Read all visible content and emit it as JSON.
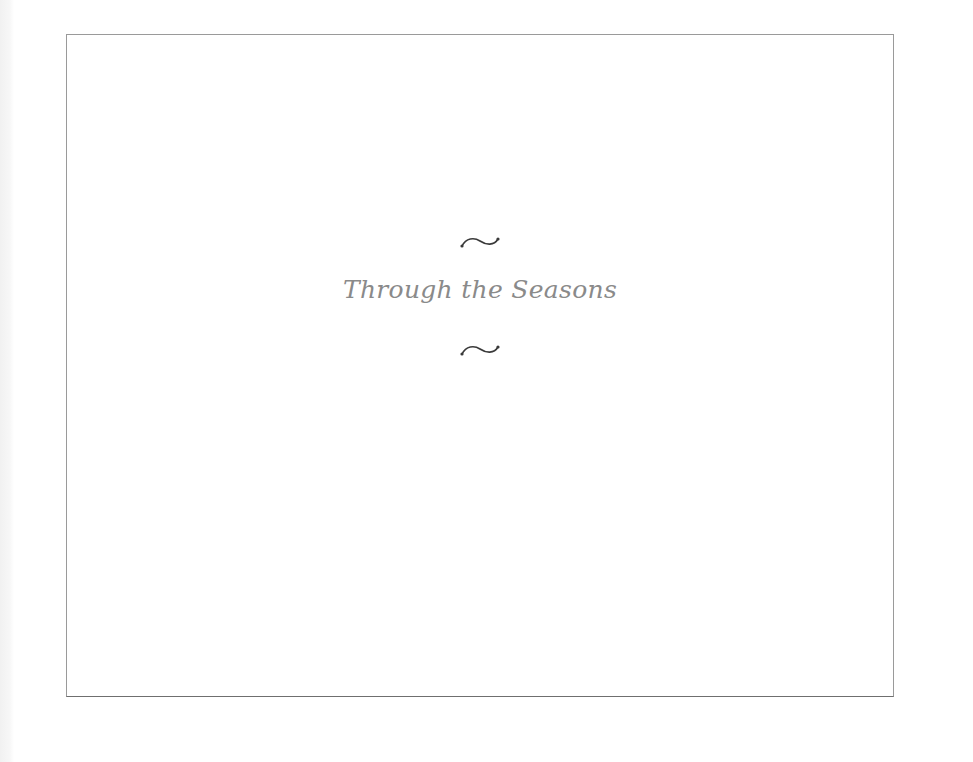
{
  "page": {
    "title": "Through the Seasons",
    "ornaments": [
      "tilde-swash-icon",
      "tilde-swash-icon"
    ],
    "colors": {
      "title_text": "#8a8a8a",
      "ornament": "#3a3a3a",
      "frame_border": "#9a9a9a",
      "background": "#ffffff"
    }
  }
}
